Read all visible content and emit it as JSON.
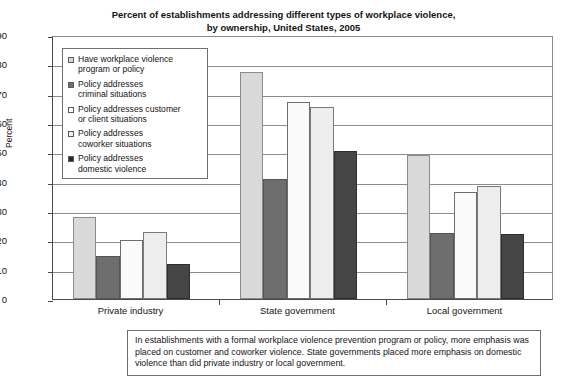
{
  "chart_data": {
    "type": "bar",
    "title": "Percent of establishments addressing different types of workplace violence, by ownership, United States, 2005",
    "title_line1": "Percent of establishments addressing different types of workplace violence,",
    "title_line2": "by ownership, United States, 2005",
    "xlabel": "",
    "ylabel": "Percent",
    "ylim": [
      0,
      90
    ],
    "ytick_step": 10,
    "yticks": [
      0,
      10,
      20,
      30,
      40,
      50,
      60,
      70,
      80,
      90
    ],
    "grid": true,
    "legend_position": "upper-left-inside",
    "categories": [
      "Private industry",
      "State government",
      "Local government"
    ],
    "series": [
      {
        "name": "Have workplace violence program or policy",
        "name_line1": "Have workplace violence",
        "name_line2": "program or policy",
        "color": "#d9d9d9",
        "values": [
          28,
          77.5,
          49
        ]
      },
      {
        "name": "Policy addresses criminal situations",
        "name_line1": "Policy addresses",
        "name_line2": "criminal situations",
        "color": "#6e6e6e",
        "values": [
          14.5,
          41,
          22.5
        ]
      },
      {
        "name": "Policy addresses customer or client situations",
        "name_line1": "Policy addresses customer",
        "name_line2": "or client situations",
        "color": "#fafafa",
        "values": [
          20,
          67,
          36.5
        ]
      },
      {
        "name": "Policy addresses coworker situations",
        "name_line1": "Policy addresses",
        "name_line2": "coworker situations",
        "color": "#ededed",
        "values": [
          23,
          65.5,
          38.5
        ]
      },
      {
        "name": "Policy addresses domestic violence",
        "name_line1": "Policy addresses",
        "name_line2": "domestic violence",
        "color": "#454545",
        "values": [
          12,
          50.5,
          22
        ]
      }
    ],
    "annotation": "In establishments with a formal workplace violence prevention program or policy, more emphasis was placed on customer and coworker violence.  State governments placed more emphasis on domestic violence than did private industry or local government."
  },
  "footnote": {
    "line1": "In establishments with a formal workplace violence prevention program or policy, more",
    "line2": "emphasis was placed on customer and coworker violence.  State governments placed",
    "line3": "more emphasis on domestic violence than did private industry or local government."
  }
}
